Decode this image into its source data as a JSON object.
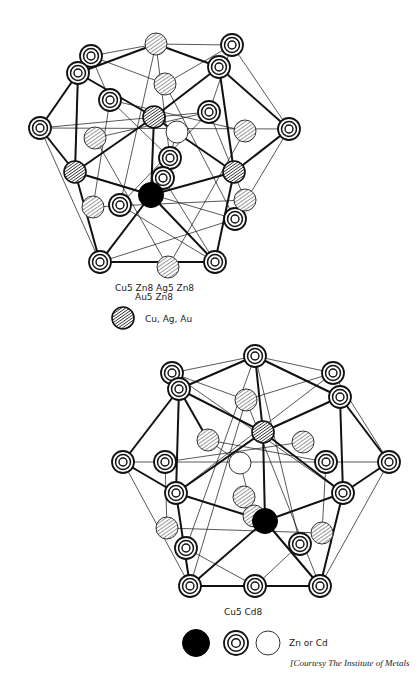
{
  "figure": {
    "top_structure": {
      "formula_line1": "Cu5 Zn8  Ag5 Zn8",
      "formula_line2": "Au5 Zn8",
      "legend": [
        {
          "glyph": "hatched",
          "label": "Cu, Ag, Au"
        }
      ],
      "atoms": [
        {
          "type": "ring",
          "x": 91,
          "y": 56
        },
        {
          "type": "ring",
          "x": 78,
          "y": 73
        },
        {
          "type": "ring",
          "x": 232,
          "y": 45
        },
        {
          "type": "ring",
          "x": 219,
          "y": 67
        },
        {
          "type": "ring",
          "x": 40,
          "y": 128
        },
        {
          "type": "ring",
          "x": 110,
          "y": 100
        },
        {
          "type": "ring",
          "x": 209,
          "y": 112
        },
        {
          "type": "ring",
          "x": 289,
          "y": 129
        },
        {
          "type": "ring",
          "x": 170,
          "y": 158
        },
        {
          "type": "ring",
          "x": 120,
          "y": 205
        },
        {
          "type": "ring",
          "x": 235,
          "y": 219
        },
        {
          "type": "ring",
          "x": 100,
          "y": 262
        },
        {
          "type": "ring",
          "x": 215,
          "y": 262
        },
        {
          "type": "ring",
          "x": 163,
          "y": 178
        },
        {
          "type": "hatch",
          "x": 156,
          "y": 44
        },
        {
          "type": "hatch",
          "x": 165,
          "y": 84
        },
        {
          "type": "hatch",
          "x": 95,
          "y": 138
        },
        {
          "type": "hatch",
          "x": 245,
          "y": 131
        },
        {
          "type": "hatch",
          "x": 168,
          "y": 267
        },
        {
          "type": "hatch",
          "x": 93,
          "y": 207
        },
        {
          "type": "hatch",
          "x": 245,
          "y": 200
        },
        {
          "type": "dark",
          "x": 154,
          "y": 117
        },
        {
          "type": "dark",
          "x": 75,
          "y": 172
        },
        {
          "type": "dark",
          "x": 234,
          "y": 172
        },
        {
          "type": "open",
          "x": 177,
          "y": 132
        },
        {
          "type": "black",
          "x": 151,
          "y": 195
        }
      ],
      "bonds_bold": [
        [
          78,
          73,
          154,
          117
        ],
        [
          154,
          117,
          219,
          67
        ],
        [
          154,
          117,
          234,
          172
        ],
        [
          75,
          172,
          154,
          117
        ],
        [
          78,
          73,
          75,
          172
        ],
        [
          219,
          67,
          234,
          172
        ],
        [
          40,
          128,
          75,
          172
        ],
        [
          40,
          128,
          78,
          73
        ],
        [
          289,
          129,
          219,
          67
        ],
        [
          289,
          129,
          234,
          172
        ],
        [
          75,
          172,
          151,
          195
        ],
        [
          151,
          195,
          234,
          172
        ],
        [
          151,
          195,
          100,
          262
        ],
        [
          151,
          195,
          215,
          262
        ],
        [
          100,
          262,
          215,
          262
        ],
        [
          154,
          117,
          151,
          195
        ],
        [
          78,
          73,
          156,
          44
        ],
        [
          156,
          44,
          219,
          67
        ],
        [
          100,
          262,
          75,
          172
        ],
        [
          215,
          262,
          234,
          172
        ]
      ],
      "bonds_thin": [
        [
          91,
          56,
          156,
          44
        ],
        [
          156,
          44,
          232,
          45
        ],
        [
          232,
          45,
          289,
          129
        ],
        [
          40,
          128,
          100,
          262
        ],
        [
          40,
          128,
          209,
          112
        ],
        [
          40,
          128,
          289,
          129
        ],
        [
          91,
          56,
          165,
          84
        ],
        [
          165,
          84,
          232,
          45
        ],
        [
          110,
          100,
          245,
          131
        ],
        [
          95,
          138,
          209,
          112
        ],
        [
          110,
          100,
          170,
          158
        ],
        [
          209,
          112,
          120,
          205
        ],
        [
          156,
          44,
          170,
          158
        ],
        [
          156,
          44,
          120,
          205
        ],
        [
          165,
          84,
          235,
          219
        ],
        [
          75,
          172,
          235,
          219
        ],
        [
          93,
          207,
          245,
          200
        ],
        [
          120,
          205,
          215,
          262
        ],
        [
          100,
          262,
          235,
          219
        ],
        [
          289,
          129,
          235,
          219
        ],
        [
          95,
          138,
          168,
          267
        ],
        [
          245,
          131,
          168,
          267
        ],
        [
          110,
          100,
          93,
          207
        ],
        [
          209,
          112,
          245,
          200
        ],
        [
          163,
          178,
          215,
          262
        ],
        [
          177,
          132,
          163,
          178
        ],
        [
          91,
          56,
          110,
          100
        ],
        [
          232,
          45,
          209,
          112
        ]
      ]
    },
    "bottom_structure": {
      "formula_line1": "Cu5  Cd8",
      "legend": [
        {
          "glyph": "black",
          "label": ""
        },
        {
          "glyph": "ring",
          "label": ""
        },
        {
          "glyph": "open",
          "label": "Zn or Cd"
        }
      ],
      "atoms": [
        {
          "type": "ring",
          "x": 172,
          "y": 373
        },
        {
          "type": "ring",
          "x": 255,
          "y": 356
        },
        {
          "type": "ring",
          "x": 333,
          "y": 373
        },
        {
          "type": "ring",
          "x": 179,
          "y": 389
        },
        {
          "type": "ring",
          "x": 340,
          "y": 397
        },
        {
          "type": "ring",
          "x": 123,
          "y": 462
        },
        {
          "type": "ring",
          "x": 165,
          "y": 462
        },
        {
          "type": "ring",
          "x": 389,
          "y": 462
        },
        {
          "type": "ring",
          "x": 176,
          "y": 493
        },
        {
          "type": "ring",
          "x": 343,
          "y": 493
        },
        {
          "type": "ring",
          "x": 186,
          "y": 548
        },
        {
          "type": "ring",
          "x": 300,
          "y": 544
        },
        {
          "type": "ring",
          "x": 190,
          "y": 586
        },
        {
          "type": "ring",
          "x": 255,
          "y": 586
        },
        {
          "type": "ring",
          "x": 320,
          "y": 586
        },
        {
          "type": "ring",
          "x": 326,
          "y": 462
        },
        {
          "type": "hatch",
          "x": 246,
          "y": 400
        },
        {
          "type": "hatch",
          "x": 208,
          "y": 440
        },
        {
          "type": "hatch",
          "x": 303,
          "y": 442
        },
        {
          "type": "hatch",
          "x": 244,
          "y": 497
        },
        {
          "type": "hatch",
          "x": 254,
          "y": 516
        },
        {
          "type": "hatch",
          "x": 167,
          "y": 528
        },
        {
          "type": "hatch",
          "x": 322,
          "y": 533
        },
        {
          "type": "dark",
          "x": 263,
          "y": 432
        },
        {
          "type": "open",
          "x": 240,
          "y": 463
        },
        {
          "type": "black",
          "x": 265,
          "y": 521
        }
      ],
      "bonds_bold": [
        [
          179,
          389,
          255,
          356
        ],
        [
          255,
          356,
          340,
          397
        ],
        [
          179,
          389,
          263,
          432
        ],
        [
          263,
          432,
          340,
          397
        ],
        [
          123,
          462,
          179,
          389
        ],
        [
          179,
          389,
          176,
          493
        ],
        [
          340,
          397,
          343,
          493
        ],
        [
          340,
          397,
          389,
          462
        ],
        [
          389,
          462,
          343,
          493
        ],
        [
          123,
          462,
          176,
          493
        ],
        [
          176,
          493,
          263,
          432
        ],
        [
          263,
          432,
          343,
          493
        ],
        [
          176,
          493,
          265,
          521
        ],
        [
          265,
          521,
          343,
          493
        ],
        [
          265,
          521,
          190,
          586
        ],
        [
          265,
          521,
          320,
          586
        ],
        [
          190,
          586,
          320,
          586
        ],
        [
          263,
          432,
          265,
          521
        ],
        [
          176,
          493,
          190,
          586
        ],
        [
          343,
          493,
          320,
          586
        ],
        [
          255,
          356,
          263,
          432
        ],
        [
          179,
          389,
          208,
          440
        ]
      ],
      "bonds_thin": [
        [
          172,
          373,
          255,
          356
        ],
        [
          255,
          356,
          333,
          373
        ],
        [
          333,
          373,
          389,
          462
        ],
        [
          123,
          462,
          389,
          462
        ],
        [
          123,
          462,
          190,
          586
        ],
        [
          389,
          462,
          320,
          586
        ],
        [
          172,
          373,
          246,
          400
        ],
        [
          246,
          400,
          333,
          373
        ],
        [
          165,
          462,
          303,
          442
        ],
        [
          208,
          440,
          326,
          462
        ],
        [
          255,
          356,
          186,
          548
        ],
        [
          255,
          356,
          300,
          544
        ],
        [
          172,
          373,
          343,
          493
        ],
        [
          333,
          373,
          176,
          493
        ],
        [
          167,
          528,
          322,
          533
        ],
        [
          186,
          548,
          255,
          586
        ],
        [
          300,
          544,
          255,
          586
        ],
        [
          165,
          462,
          167,
          528
        ],
        [
          326,
          462,
          322,
          533
        ],
        [
          240,
          463,
          254,
          516
        ],
        [
          208,
          440,
          240,
          463
        ],
        [
          246,
          400,
          190,
          586
        ],
        [
          246,
          400,
          320,
          586
        ]
      ]
    },
    "credit": "[Courtesy The Institute of Metals"
  },
  "colors": {
    "ink": "#111111",
    "paper": "#ffffff"
  }
}
